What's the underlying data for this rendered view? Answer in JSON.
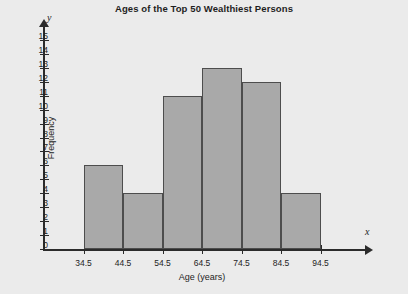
{
  "chart_data": {
    "type": "bar",
    "title": "Ages of the Top 50 Wealthiest Persons",
    "xlabel": "Age (years)",
    "ylabel": "Frequency",
    "x_var_symbol": "x",
    "y_var_symbol": "y",
    "categories": [
      "34.5-44.5",
      "44.5-54.5",
      "54.5-64.5",
      "64.5-74.5",
      "74.5-84.5",
      "84.5-94.5"
    ],
    "values": [
      6,
      4,
      11,
      13,
      12,
      4
    ],
    "bin_edges": [
      34.5,
      44.5,
      54.5,
      64.5,
      74.5,
      84.5,
      94.5
    ],
    "x_tick_labels": [
      "34.5",
      "44.5",
      "54.5",
      "64.5",
      "74.5",
      "84.5",
      "94.5"
    ],
    "y_tick_labels": [
      "0",
      "1",
      "2",
      "3",
      "4",
      "5",
      "6",
      "7",
      "8",
      "9",
      "10",
      "11",
      "12",
      "13",
      "14",
      "15"
    ],
    "y_ticks": [
      0,
      1,
      2,
      3,
      4,
      5,
      6,
      7,
      8,
      9,
      10,
      11,
      12,
      13,
      14,
      15
    ],
    "ylim": [
      0,
      15
    ],
    "xlim": [
      24.5,
      104.5
    ],
    "grid": false,
    "legend": "none",
    "total_frequency": 50,
    "colors": {
      "background": "#ebebeb",
      "bar_fill": "#a9a9a9",
      "bar_border": "#4d4d4d",
      "axis": "#2b2b2b",
      "text": "#1e1e1e"
    }
  }
}
